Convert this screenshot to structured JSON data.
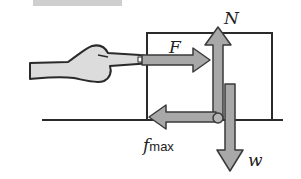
{
  "diagram": {
    "labels": {
      "applied_force": "F",
      "normal_force": "N",
      "friction_symbol": "f",
      "friction_subscript": "max",
      "weight": "w"
    },
    "colors": {
      "arrow_fill": "#a8a8a8",
      "arrow_stroke": "#3a3a3a",
      "line": "#2a2a2a",
      "hand_fill": "#dcdcdc",
      "top_bar": "#c8c8c8"
    }
  }
}
